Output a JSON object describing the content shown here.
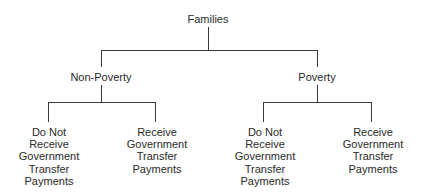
{
  "diagram": {
    "type": "tree",
    "root": {
      "label": "Families",
      "children": [
        {
          "label": "Non-Poverty",
          "children": [
            {
              "label": "Do Not Receive Government Transfer Payments",
              "lines": [
                "Do Not",
                "Receive",
                "Government",
                "Transfer",
                "Payments"
              ]
            },
            {
              "label": "Receive Government Transfer Payments",
              "lines": [
                "Receive",
                "Government",
                "Transfer",
                "Payments"
              ]
            }
          ]
        },
        {
          "label": "Poverty",
          "children": [
            {
              "label": "Do Not Receive Government Transfer Payments",
              "lines": [
                "Do Not",
                "Receive",
                "Government",
                "Transfer",
                "Payments"
              ]
            },
            {
              "label": "Receive Government Transfer Payments",
              "lines": [
                "Receive",
                "Government",
                "Transfer",
                "Payments"
              ]
            }
          ]
        }
      ]
    },
    "line_color": "#3a3a3a",
    "text_color": "#2a2a2a"
  }
}
